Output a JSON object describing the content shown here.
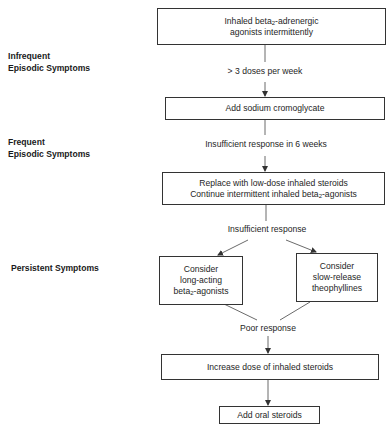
{
  "stages": [
    {
      "id": "infrequent",
      "lines": [
        "Infrequent",
        "Episodic Symptoms"
      ]
    },
    {
      "id": "frequent",
      "lines": [
        "Frequent",
        "Episodic Symptoms"
      ]
    },
    {
      "id": "persistent",
      "lines": [
        "Persistent Symptoms"
      ]
    }
  ],
  "nodes": {
    "n1": {
      "pre": "Inhaled beta",
      "sub": "2",
      "post": "-adrenergic",
      "line2": "agonists intermittently"
    },
    "n2": {
      "line1": "Add sodium cromoglycate"
    },
    "n3": {
      "line1": "Replace with low-dose inhaled steroids",
      "pre": "Continue intermittent inhaled beta",
      "sub": "2",
      "post": "-agonists"
    },
    "n4": {
      "line1": "Consider",
      "line2": "long-acting",
      "pre": "beta",
      "sub": "2",
      "post": "-agonists"
    },
    "n5": {
      "line1": "Consider",
      "line2": "slow-release",
      "line3": "theophyllines"
    },
    "n6": {
      "line1": "Increase dose of inhaled steroids"
    },
    "n7": {
      "line1": "Add oral steroids"
    }
  },
  "conditions": {
    "c1": "> 3 doses per week",
    "c2": "Insufficient response in 6 weeks",
    "c3": "Insufficient response",
    "c4": "Poor response"
  }
}
